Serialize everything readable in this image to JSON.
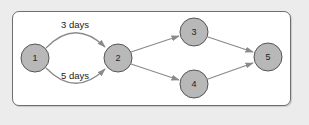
{
  "diagram": {
    "title": "",
    "colors": {
      "background": "#ececec",
      "frame_fill": "#ffffff",
      "frame_border": "#6e6e6e",
      "node_fill": "#b8b8b8",
      "node_stroke": "#555555",
      "edge": "#8a8a8a"
    },
    "nodes": [
      {
        "id": "1",
        "label": "1",
        "x": 35,
        "y": 58
      },
      {
        "id": "2",
        "label": "2",
        "x": 118,
        "y": 58
      },
      {
        "id": "3",
        "label": "3",
        "x": 194,
        "y": 32
      },
      {
        "id": "4",
        "label": "4",
        "x": 194,
        "y": 84
      },
      {
        "id": "5",
        "label": "5",
        "x": 268,
        "y": 57
      }
    ],
    "edges": [
      {
        "from": "1",
        "to": "2",
        "label": "3 days",
        "curve": "upper"
      },
      {
        "from": "1",
        "to": "2",
        "label": "5 days",
        "curve": "lower"
      },
      {
        "from": "2",
        "to": "3",
        "label": ""
      },
      {
        "from": "2",
        "to": "4",
        "label": ""
      },
      {
        "from": "3",
        "to": "5",
        "label": ""
      },
      {
        "from": "4",
        "to": "5",
        "label": ""
      }
    ],
    "edge_labels": {
      "upper": "3 days",
      "lower": "5 days"
    }
  }
}
